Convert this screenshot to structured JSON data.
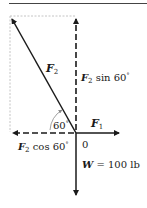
{
  "diagram": {
    "type": "force-vector-diagram",
    "origin_label": "0",
    "angle_label": "60",
    "angle_unit_symbol": "°",
    "vectors": {
      "F2": {
        "symbol": "F",
        "subscript": "2",
        "direction": "up-left at 60° from negative x-axis"
      },
      "F2_sin": {
        "symbol": "F",
        "subscript": "2",
        "text": "sin 60",
        "deg": "°",
        "direction": "up",
        "style": "dashed"
      },
      "F2_cos": {
        "symbol": "F",
        "subscript": "2",
        "text": "cos 60",
        "deg": "°",
        "direction": "left",
        "style": "dashed"
      },
      "F1": {
        "symbol": "F",
        "subscript": "1",
        "direction": "right"
      },
      "W": {
        "symbol": "W",
        "text": "= 100 lb",
        "direction": "down"
      }
    },
    "colors": {
      "ink": "#1a1a1a",
      "construction_lines": "#b0b0b0",
      "angle_arc": "#888888"
    }
  }
}
